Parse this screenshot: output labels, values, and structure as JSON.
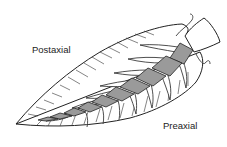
{
  "diagram": {
    "labels": {
      "postaxial": "Postaxial",
      "preaxial": "Preaxial"
    },
    "colors": {
      "outline": "#222222",
      "axis_fill": "#9a9a9a",
      "basal_fill": "#ffffff",
      "background": "#ffffff"
    }
  }
}
